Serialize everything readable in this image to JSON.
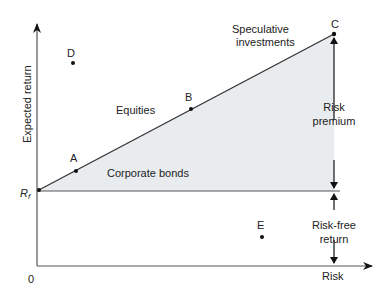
{
  "diagram": {
    "axes": {
      "y_label": "Expected return",
      "x_label": "Risk",
      "origin_label": "0",
      "rf_label": "R",
      "rf_subscript": "f"
    },
    "points": [
      {
        "id": "A",
        "label": "A",
        "x": 76,
        "y": 171
      },
      {
        "id": "B",
        "label": "B",
        "x": 191,
        "y": 109
      },
      {
        "id": "C",
        "label": "C",
        "x": 334,
        "y": 34
      },
      {
        "id": "D",
        "label": "D",
        "x": 73,
        "y": 63
      },
      {
        "id": "E",
        "label": "E",
        "x": 262,
        "y": 237
      }
    ],
    "regions": {
      "corporate_bonds": "Corporate bonds",
      "equities": "Equities",
      "speculative_line1": "Speculative",
      "speculative_line2": "investments"
    },
    "annotations": {
      "risk_premium_line1": "Risk",
      "risk_premium_line2": "premium",
      "risk_free_line1": "Risk-free",
      "risk_free_line2": "return"
    },
    "colors": {
      "fill": "#e9ecef",
      "line": "#333333",
      "axis": "#555555"
    }
  }
}
